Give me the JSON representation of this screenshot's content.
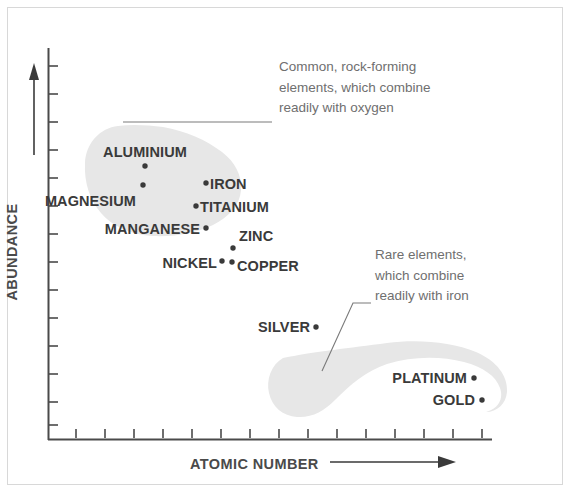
{
  "figure": {
    "title": "",
    "background_color": "#ffffff",
    "frame_color": "#d8d8d8",
    "blob_color": "#e6e6e6",
    "dot_color": "#3a3a3a",
    "label_color": "#3a3a3a",
    "annotation_color": "#6f6f6f",
    "axis_color": "#4a4a4a"
  },
  "axes": {
    "x_title": "ATOMIC NUMBER",
    "y_title": "ABUNDANCE",
    "x_arrow": "arrow-right",
    "y_arrow": "arrow-up",
    "x_tick_count": 15,
    "y_tick_count": 14,
    "x_tick_labels": [],
    "y_tick_labels": []
  },
  "annotations": [
    {
      "id": "common-elements-note",
      "text": "Common, rock-forming\nelements, which combine\nreadily with oxygen",
      "x": 279,
      "y": 57
    },
    {
      "id": "rare-elements-note",
      "text": "Rare elements,\nwhich combine\nreadily with iron",
      "x": 375,
      "y": 245
    }
  ],
  "groups": [
    {
      "id": "common-group",
      "name": "Common, rock-forming elements"
    },
    {
      "id": "rare-group",
      "name": "Rare elements"
    }
  ],
  "chart_data": {
    "type": "scatter",
    "title": "",
    "xlabel": "ATOMIC NUMBER",
    "ylabel": "ABUNDANCE",
    "grid": false,
    "legend_position": "none",
    "axis_note": "Both axes are qualitative / unlabelled; values below are read off pixel positions normalised to the drawn axes (0 = axis origin, 1 = far end).",
    "xlim": [
      0,
      1
    ],
    "ylim": [
      0,
      1
    ],
    "series": [
      {
        "name": "Common, rock-forming elements",
        "group": "common-group",
        "points": [
          {
            "label": "ALUMINIUM",
            "x": 0.22,
            "y": 0.7,
            "label_side": "above"
          },
          {
            "label": "MAGNESIUM",
            "x": 0.21,
            "y": 0.65,
            "label_side": "left"
          },
          {
            "label": "IRON",
            "x": 0.355,
            "y": 0.66,
            "label_side": "right"
          },
          {
            "label": "TITANIUM",
            "x": 0.335,
            "y": 0.6,
            "label_side": "right"
          },
          {
            "label": "MANGANESE",
            "x": 0.355,
            "y": 0.545,
            "label_side": "left"
          },
          {
            "label": "ZINC",
            "x": 0.42,
            "y": 0.49,
            "label_side": "above-right"
          },
          {
            "label": "NICKEL",
            "x": 0.395,
            "y": 0.455,
            "label_side": "left"
          },
          {
            "label": "COPPER",
            "x": 0.415,
            "y": 0.452,
            "label_side": "right"
          }
        ]
      },
      {
        "name": "Rare elements",
        "group": "rare-group",
        "points": [
          {
            "label": "SILVER",
            "x": 0.605,
            "y": 0.29,
            "label_side": "left"
          },
          {
            "label": "PLATINUM",
            "x": 0.96,
            "y": 0.16,
            "label_side": "left"
          },
          {
            "label": "GOLD",
            "x": 0.98,
            "y": 0.105,
            "label_side": "left"
          }
        ]
      }
    ]
  },
  "elements": [
    {
      "label": "ALUMINIUM",
      "dot_x": 145,
      "dot_y": 166,
      "text_x": 145,
      "text_y": 152,
      "align": "center",
      "group": "common-group"
    },
    {
      "label": "MAGNESIUM",
      "dot_x": 143,
      "dot_y": 185,
      "text_x": 136,
      "text_y": 201,
      "align": "right",
      "group": "common-group"
    },
    {
      "label": "IRON",
      "dot_x": 206,
      "dot_y": 183,
      "text_x": 210,
      "text_y": 184,
      "align": "left",
      "group": "common-group"
    },
    {
      "label": "TITANIUM",
      "dot_x": 196,
      "dot_y": 206,
      "text_x": 200,
      "text_y": 207,
      "align": "left",
      "group": "common-group"
    },
    {
      "label": "MANGANESE",
      "dot_x": 206,
      "dot_y": 228,
      "text_x": 200,
      "text_y": 229,
      "align": "right",
      "group": "common-group"
    },
    {
      "label": "ZINC",
      "dot_x": 233,
      "dot_y": 248,
      "text_x": 239,
      "text_y": 236,
      "align": "left",
      "group": "common-group"
    },
    {
      "label": "NICKEL",
      "dot_x": 222,
      "dot_y": 261,
      "text_x": 217,
      "text_y": 263,
      "align": "right",
      "group": "common-group"
    },
    {
      "label": "COPPER",
      "dot_x": 232,
      "dot_y": 262,
      "text_x": 237,
      "text_y": 266,
      "align": "left",
      "group": "common-group"
    },
    {
      "label": "SILVER",
      "dot_x": 316,
      "dot_y": 327,
      "text_x": 310,
      "text_y": 327,
      "align": "right",
      "group": "rare-group"
    },
    {
      "label": "PLATINUM",
      "dot_x": 474,
      "dot_y": 378,
      "text_x": 467,
      "text_y": 378,
      "align": "right",
      "group": "rare-group"
    },
    {
      "label": "GOLD",
      "dot_x": 482,
      "dot_y": 400,
      "text_x": 475,
      "text_y": 400,
      "align": "right",
      "group": "rare-group"
    }
  ]
}
